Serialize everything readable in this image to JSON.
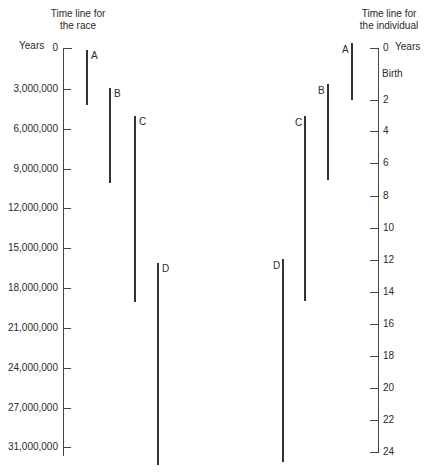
{
  "left": {
    "title_line1": "Time line for",
    "title_line2": "the race",
    "unit": "Years",
    "ticks": [
      {
        "label": "0",
        "y": 48
      },
      {
        "label": "3,000,000",
        "y": 89
      },
      {
        "label": "6,000,000",
        "y": 129
      },
      {
        "label": "9,000,000",
        "y": 169
      },
      {
        "label": "12,000,000",
        "y": 208
      },
      {
        "label": "15,000,000",
        "y": 248
      },
      {
        "label": "18,000,000",
        "y": 288
      },
      {
        "label": "21,000,000",
        "y": 328
      },
      {
        "label": "24,000,000",
        "y": 368
      },
      {
        "label": "27,000,000",
        "y": 408
      },
      {
        "label": "31,000,000",
        "y": 447
      }
    ],
    "bars": [
      {
        "label": "A",
        "x": 86,
        "y1": 50,
        "y2": 105
      },
      {
        "label": "B",
        "x": 109,
        "y1": 88,
        "y2": 183
      },
      {
        "label": "C",
        "x": 134,
        "y1": 116,
        "y2": 302
      },
      {
        "label": "D",
        "x": 157,
        "y1": 263,
        "y2": 465
      }
    ]
  },
  "right": {
    "title_line1": "Time line for",
    "title_line2": "the individual",
    "unit": "Years",
    "birth_label": "Birth",
    "ticks": [
      {
        "label": "0",
        "y": 48
      },
      {
        "label": "2",
        "y": 100
      },
      {
        "label": "4",
        "y": 131
      },
      {
        "label": "6",
        "y": 163
      },
      {
        "label": "8",
        "y": 196
      },
      {
        "label": "10",
        "y": 228
      },
      {
        "label": "12",
        "y": 260
      },
      {
        "label": "14",
        "y": 292
      },
      {
        "label": "16",
        "y": 324
      },
      {
        "label": "18",
        "y": 356
      },
      {
        "label": "20",
        "y": 388
      },
      {
        "label": "22",
        "y": 420
      },
      {
        "label": "24",
        "y": 452
      }
    ],
    "bars": [
      {
        "label": "A",
        "x": 351,
        "y1": 43,
        "y2": 100
      },
      {
        "label": "B",
        "x": 327,
        "y1": 84,
        "y2": 180
      },
      {
        "label": "C",
        "x": 304,
        "y1": 116,
        "y2": 301
      },
      {
        "label": "D",
        "x": 282,
        "y1": 259,
        "y2": 462
      }
    ]
  }
}
